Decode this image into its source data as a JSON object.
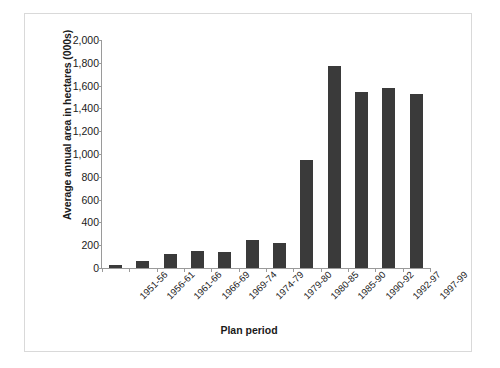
{
  "chart_data": {
    "type": "bar",
    "title": "",
    "xlabel": "Plan period",
    "ylabel": "Average annual area in hectares (000s)",
    "categories": [
      "1951-56",
      "1956-61",
      "1961-66",
      "1966-69",
      "1969-74",
      "1974-79",
      "1979-80",
      "1980-85",
      "1985-90",
      "1990-92",
      "1992-97",
      "1997-99"
    ],
    "values": [
      25,
      60,
      120,
      150,
      140,
      245,
      220,
      945,
      1775,
      1545,
      1580,
      1525
    ],
    "ylim": [
      0,
      2000
    ],
    "ytick_values": [
      0,
      200,
      400,
      600,
      800,
      1000,
      1200,
      1400,
      1600,
      1800,
      2000
    ],
    "ytick_labels": [
      "0",
      "200",
      "400",
      "600",
      "800",
      "1,000",
      "1,200",
      "1,400",
      "1,600",
      "1,800",
      "2,000"
    ],
    "grid": false,
    "legend": null,
    "bar_color": "#3a3a3a",
    "axis_color": "#9a9a9a",
    "background": "#ffffff"
  }
}
